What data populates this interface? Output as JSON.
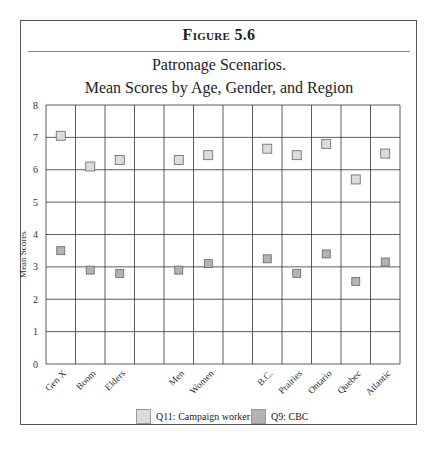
{
  "figure_label": "Figure 5.6",
  "title_line1": "Patronage Scenarios.",
  "title_line2": "Mean Scores by Age, Gender, and Region",
  "legend": {
    "q11": "Q11: Campaign worker",
    "q9": "Q9: CBC"
  },
  "colors": {
    "q11_fill": "#dcdcdc",
    "q9_fill": "#b3b3b3",
    "marker_stroke": "#666666",
    "grid": "#333333"
  },
  "chart_data": {
    "type": "scatter",
    "xlabel": "",
    "ylabel": "Mean Scores",
    "ylim": [
      0,
      8
    ],
    "yticks": [
      0,
      1,
      2,
      3,
      4,
      5,
      6,
      7,
      8
    ],
    "grid": true,
    "legend_position": "bottom",
    "categories": [
      "Gen X",
      "Boom",
      "Elders",
      "",
      "Men",
      "Women",
      "",
      "B.C.",
      "Prairies",
      "Ontario",
      "Quebec",
      "Atlantic"
    ],
    "series": [
      {
        "name": "Q11: Campaign worker",
        "values": [
          7.05,
          6.1,
          6.3,
          null,
          6.3,
          6.45,
          null,
          6.65,
          6.45,
          6.8,
          5.7,
          6.5
        ]
      },
      {
        "name": "Q9: CBC",
        "values": [
          3.5,
          2.9,
          2.8,
          null,
          2.9,
          3.1,
          null,
          3.25,
          2.8,
          3.4,
          2.55,
          3.15
        ]
      }
    ]
  }
}
